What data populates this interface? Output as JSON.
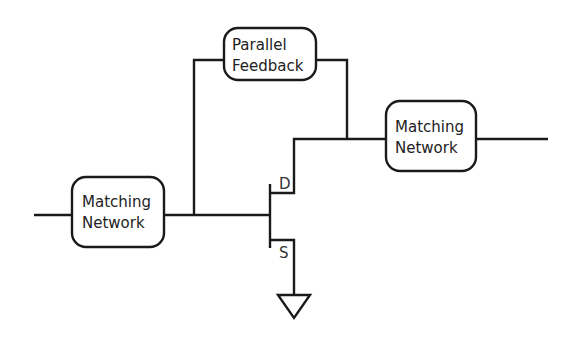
{
  "diagram": {
    "type": "circuit-schematic",
    "blocks": {
      "feedback": {
        "line1": "Parallel",
        "line2": "Feedback"
      },
      "input_match": {
        "line1": "Matching",
        "line2": "Network"
      },
      "output_match": {
        "line1": "Matching",
        "line2": "Network"
      }
    },
    "transistor": {
      "drain_label": "D",
      "source_label": "S"
    },
    "colors": {
      "line": "#1a1a1a",
      "background": "#ffffff"
    }
  }
}
